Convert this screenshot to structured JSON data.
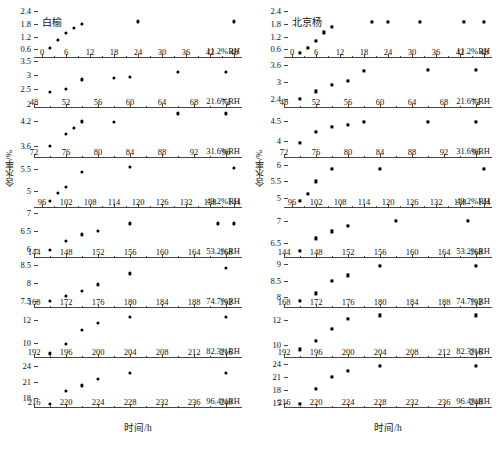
{
  "figure": {
    "xlabel": "时间/h",
    "ylabel": "含水率/%",
    "panel_count": 8
  },
  "chart_data": [
    {
      "type": "scatter",
      "title": "白榆",
      "marker": "circle",
      "xlabel": "时间/h",
      "ylabel": "含水率/%",
      "grid": false,
      "legend": "none",
      "panels": [
        {
          "rh_label": "11.2%RH",
          "yticks": [
            0.6,
            1.2,
            1.8,
            2.4
          ],
          "ylim": [
            0.2,
            2.55
          ],
          "xticks": [
            0,
            6,
            12,
            18,
            24,
            30,
            36,
            42,
            48
          ],
          "xlim": [
            -2,
            50
          ],
          "x": [
            2,
            4,
            6,
            8,
            10,
            24,
            48
          ],
          "y": [
            0.67,
            1.05,
            1.38,
            1.62,
            1.8,
            1.92,
            1.92
          ]
        },
        {
          "rh_label": "21.6%RH",
          "yticks": [
            2.0,
            2.5,
            3.0,
            3.5
          ],
          "ylim": [
            1.85,
            3.6
          ],
          "xticks": [
            48,
            52,
            56,
            60,
            64,
            68,
            72
          ],
          "xlim": [
            48,
            74
          ],
          "x": [
            50,
            52,
            54,
            58,
            60,
            66,
            72
          ],
          "y": [
            2.4,
            2.51,
            2.85,
            2.91,
            2.95,
            3.12,
            3.12
          ]
        },
        {
          "rh_label": "31.6%RH",
          "yticks": [
            3.6,
            4.2
          ],
          "ylim": [
            3.3,
            4.5
          ],
          "xticks": [
            72,
            76,
            80,
            84,
            88,
            92,
            96
          ],
          "xlim": [
            72,
            98
          ],
          "x": [
            74,
            76,
            77,
            78,
            82,
            90,
            96
          ],
          "y": [
            3.59,
            3.88,
            4.02,
            4.18,
            4.17,
            4.37,
            4.37
          ]
        },
        {
          "rh_label": "43.2%RH",
          "yticks": [
            5.0,
            5.5
          ],
          "ylim": [
            4.62,
            5.75
          ],
          "xticks": [
            96,
            102,
            108,
            114,
            120,
            126,
            132,
            138,
            144
          ],
          "xlim": [
            94,
            146
          ],
          "x": [
            98,
            100,
            102,
            106,
            118,
            144
          ],
          "y": [
            4.78,
            4.96,
            5.1,
            5.44,
            5.54,
            5.53
          ]
        },
        {
          "rh_label": "53.2%RH",
          "yticks": [
            6.0,
            6.5,
            7.0
          ],
          "ylim": [
            5.75,
            7.15
          ],
          "xticks": [
            144,
            148,
            152,
            156,
            160,
            164,
            168
          ],
          "xlim": [
            144,
            170
          ],
          "x": [
            146,
            148,
            150,
            152,
            156,
            167,
            169
          ],
          "y": [
            5.98,
            6.23,
            6.41,
            6.52,
            6.72,
            6.72,
            6.72
          ]
        },
        {
          "rh_label": "74.7%RH",
          "yticks": [
            7.5,
            8.0,
            8.5
          ],
          "ylim": [
            7.3,
            8.7
          ],
          "xticks": [
            168,
            172,
            176,
            180,
            184,
            188,
            192
          ],
          "xlim": [
            168,
            194
          ],
          "x": [
            170,
            172,
            174,
            176,
            180,
            192
          ],
          "y": [
            7.5,
            7.65,
            7.79,
            7.96,
            8.27,
            8.42
          ]
        },
        {
          "rh_label": "82.3%RH",
          "yticks": [
            10,
            12
          ],
          "ylim": [
            8.7,
            13.0
          ],
          "xticks": [
            192,
            196,
            200,
            204,
            208,
            212,
            216
          ],
          "xlim": [
            192,
            218
          ],
          "x": [
            194,
            196,
            198,
            200,
            204,
            216
          ],
          "y": [
            9.1,
            9.9,
            11.1,
            11.7,
            12.2,
            12.2
          ]
        },
        {
          "rh_label": "96.4%RH",
          "yticks": [
            18,
            21,
            24
          ],
          "ylim": [
            16.2,
            25.5
          ],
          "xticks": [
            216,
            220,
            224,
            228,
            232,
            236,
            240
          ],
          "xlim": [
            216,
            242
          ],
          "x": [
            218,
            220,
            222,
            224,
            228,
            240
          ],
          "y": [
            16.9,
            19.4,
            20.4,
            21.6,
            22.7,
            22.7
          ]
        }
      ]
    },
    {
      "type": "scatter",
      "title": "北京杨",
      "marker": "square",
      "xlabel": "时间/h",
      "ylabel": "含水率/%",
      "grid": false,
      "legend": "none",
      "panels": [
        {
          "rh_label": "11.2%RH",
          "yticks": [
            0.6,
            1.2,
            1.8,
            2.4
          ],
          "ylim": [
            0.2,
            2.55
          ],
          "xticks": [
            0,
            6,
            12,
            18,
            24,
            30,
            36,
            42,
            48
          ],
          "xlim": [
            -2,
            50
          ],
          "x": [
            2,
            4,
            6,
            8,
            10,
            20,
            24,
            32,
            43,
            48
          ],
          "y": [
            0.45,
            0.68,
            1.02,
            1.4,
            1.67,
            1.88,
            1.9,
            1.9,
            1.9,
            1.9
          ]
        },
        {
          "rh_label": "21.6%RH",
          "yticks": [
            2.4,
            3.0,
            3.6
          ],
          "ylim": [
            2.1,
            3.85
          ],
          "xticks": [
            48,
            52,
            56,
            60,
            64,
            68,
            72
          ],
          "xlim": [
            48,
            74
          ],
          "x": [
            50,
            52,
            54,
            56,
            58,
            66,
            72
          ],
          "y": [
            2.43,
            2.68,
            2.91,
            3.06,
            3.4,
            3.43,
            3.43
          ]
        },
        {
          "rh_label": "31.6%RH",
          "yticks": [
            4.0,
            4.5
          ],
          "ylim": [
            3.6,
            4.8
          ],
          "xticks": [
            72,
            76,
            80,
            84,
            88,
            92,
            96
          ],
          "xlim": [
            72,
            98
          ],
          "x": [
            74,
            76,
            78,
            80,
            82,
            90,
            96
          ],
          "y": [
            3.96,
            4.22,
            4.34,
            4.4,
            4.47,
            4.47,
            4.47
          ]
        },
        {
          "rh_label": "43.2%RH",
          "yticks": [
            5.0,
            5.5,
            6.0
          ],
          "ylim": [
            4.7,
            6.2
          ],
          "xticks": [
            96,
            102,
            108,
            114,
            120,
            126,
            132,
            138,
            144
          ],
          "xlim": [
            94,
            146
          ],
          "x": [
            98,
            100,
            102,
            106,
            118,
            144
          ],
          "y": [
            4.92,
            5.13,
            5.5,
            5.88,
            5.88,
            5.88
          ]
        },
        {
          "rh_label": "53.2%RH",
          "yticks": [
            6.5,
            7.0
          ],
          "ylim": [
            6.15,
            7.3
          ],
          "xticks": [
            144,
            148,
            152,
            156,
            160,
            164,
            168
          ],
          "xlim": [
            144,
            170
          ],
          "x": [
            146,
            148,
            150,
            152,
            158,
            167
          ],
          "y": [
            6.32,
            6.6,
            6.76,
            6.89,
            7.0,
            7.0
          ]
        },
        {
          "rh_label": "74.7%RH",
          "yticks": [
            8.0,
            8.5,
            9.0
          ],
          "ylim": [
            7.65,
            9.2
          ],
          "xticks": [
            168,
            172,
            176,
            180,
            184,
            188,
            192
          ],
          "xlim": [
            168,
            194
          ],
          "x": [
            170,
            172,
            174,
            176,
            180,
            192
          ],
          "y": [
            7.87,
            8.1,
            8.5,
            8.66,
            8.95,
            8.95
          ]
        },
        {
          "rh_label": "82.3%RH",
          "yticks": [
            10,
            12
          ],
          "ylim": [
            8.9,
            13.0
          ],
          "xticks": [
            192,
            196,
            200,
            204,
            208,
            212,
            216
          ],
          "xlim": [
            192,
            218
          ],
          "x": [
            194,
            196,
            198,
            200,
            204,
            216
          ],
          "y": [
            9.6,
            10.3,
            11.3,
            12.1,
            12.4,
            12.4
          ]
        },
        {
          "rh_label": "96.4%RH",
          "yticks": [
            15,
            18,
            21,
            24
          ],
          "ylim": [
            13.8,
            25.5
          ],
          "xticks": [
            216,
            220,
            224,
            228,
            232,
            236,
            240
          ],
          "xlim": [
            216,
            242
          ],
          "x": [
            218,
            220,
            222,
            224,
            228,
            240
          ],
          "y": [
            14.7,
            18.2,
            21.0,
            22.5,
            23.7,
            23.7
          ]
        }
      ]
    }
  ]
}
